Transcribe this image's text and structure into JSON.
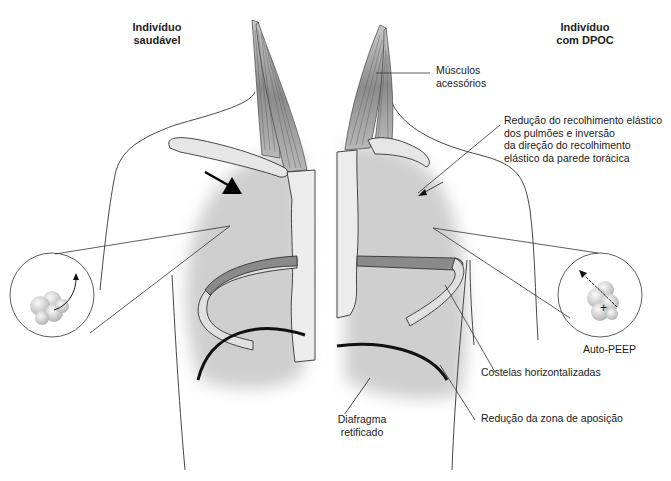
{
  "diagram": {
    "type": "anatomical comparison",
    "colors": {
      "lung_fill": "#d2d2d2",
      "sternum_fill": "#ebebeb",
      "rib_upper_fill": "#8a8a8a",
      "rib_lower_fill": "#e0e0e0",
      "diaphragm": "#111111",
      "outline": "#333333"
    }
  },
  "left_panel": {
    "title_line1": "Indivíduo",
    "title_line2": "saudável"
  },
  "right_panel": {
    "title_line1": "Indivíduo",
    "title_line2": "com DPOC"
  },
  "labels": {
    "accessory_muscles_1": "Músculos",
    "accessory_muscles_2": "acessórios",
    "elastic_recoil_1": "Redução do recolhimento elástico",
    "elastic_recoil_2": "dos pulmões e inversão",
    "elastic_recoil_3": "da direção do recolhimento",
    "elastic_recoil_4": "elástico da parede torácica",
    "auto_peep": "Auto-PEEP",
    "plus_sign": "+",
    "horizontal_ribs": "Costelas horizontalizadas",
    "apposition_zone": "Redução da zona de aposição",
    "flattened_diaphragm_1": "Diafragma",
    "flattened_diaphragm_2": "retificado"
  }
}
